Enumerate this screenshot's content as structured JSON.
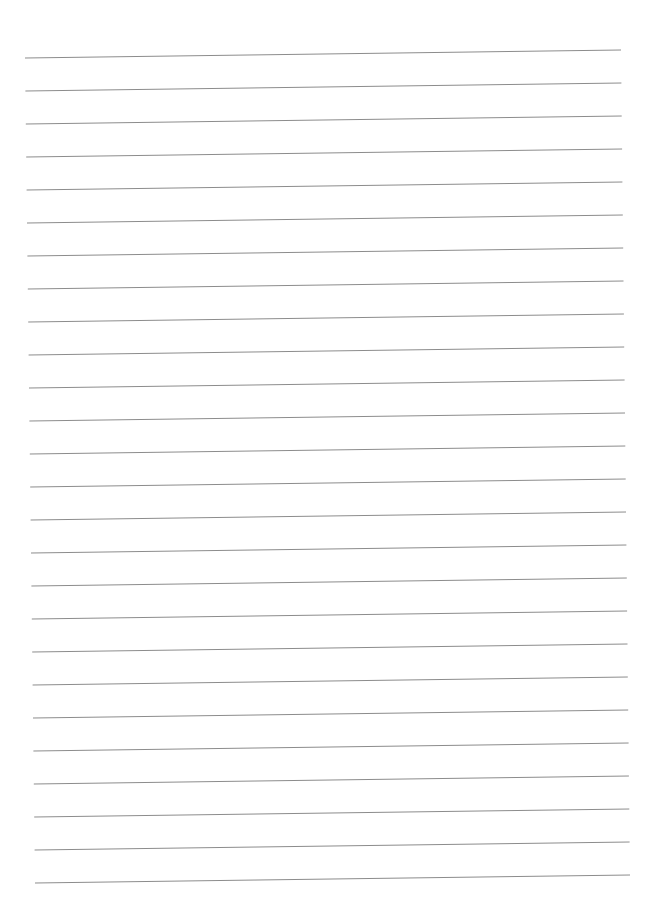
{
  "page": {
    "background": "#ffffff",
    "width": 647,
    "height": 906
  },
  "ruled_lines": {
    "count": 26,
    "color": "#8c8c8c",
    "stroke_width": 1,
    "spacing": 33,
    "first_line": {
      "left": {
        "x": 25,
        "y": 58
      },
      "right": {
        "x": 621,
        "y": 50
      }
    },
    "last_line": {
      "left": {
        "x": 35,
        "y": 883
      },
      "right": {
        "x": 630,
        "y": 875
      }
    }
  }
}
